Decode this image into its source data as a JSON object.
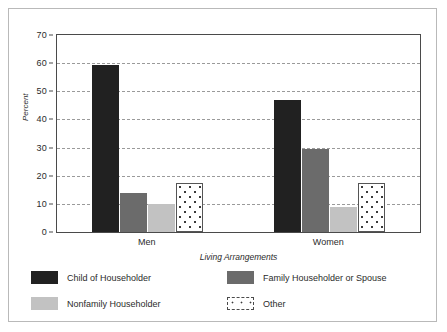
{
  "chart_data": {
    "type": "bar",
    "title": "",
    "xlabel": "Living Arrangements",
    "ylabel": "Percent",
    "categories": [
      "Men",
      "Women"
    ],
    "ylim": [
      0,
      70
    ],
    "yticks": [
      0,
      10,
      20,
      30,
      40,
      50,
      60,
      70
    ],
    "grid": true,
    "legend_position": "bottom",
    "series": [
      {
        "name": "Child of Householder",
        "color": "#212121",
        "values": [
          59.5,
          47
        ]
      },
      {
        "name": "Family Householder or Spouse",
        "color": "#6b6b6b",
        "values": [
          14,
          29.5
        ]
      },
      {
        "name": "Nonfamily Householder",
        "color": "#c2c2c2",
        "values": [
          10,
          9
        ]
      },
      {
        "name": "Other",
        "color": "#ffffff",
        "values": [
          17.5,
          17.5
        ]
      }
    ]
  },
  "axis": {
    "y_labels": [
      "70",
      "60",
      "50",
      "40",
      "30",
      "20",
      "10",
      "0"
    ],
    "y_title": "Percent",
    "x_labels": [
      "Men",
      "Women"
    ],
    "x_title": "Living Arrangements"
  },
  "legend": {
    "items": [
      {
        "label": "Child of Householder",
        "swatch": "dark"
      },
      {
        "label": "Family Householder or Spouse",
        "swatch": "mid"
      },
      {
        "label": "Nonfamily Householder",
        "swatch": "light"
      },
      {
        "label": "Other",
        "swatch": "dotted"
      }
    ]
  },
  "colors": {
    "child_of_householder": "#212121",
    "family_householder_or_spouse": "#6b6b6b",
    "nonfamily_householder": "#c2c2c2",
    "other": "#ffffff",
    "frame": "#b9b9b9",
    "axis": "#4a4a4a",
    "gridline": "#9a9a9a"
  }
}
